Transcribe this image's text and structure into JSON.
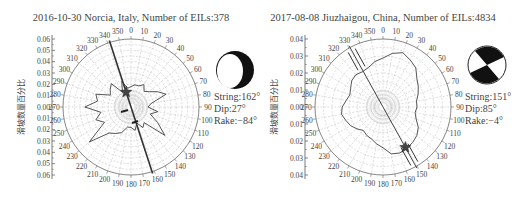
{
  "chart_data": [
    {
      "type": "polar-rose",
      "title": "2016-10-30 Norcia, Italy, Number of EILs:378",
      "ylabel": "滑坡数量百分比",
      "yticks": [
        "0.06",
        "0.05",
        "0.04",
        "0.03",
        "0.02",
        "0.01",
        "0.00",
        "0.01",
        "0.02",
        "0.03",
        "0.04",
        "0.05",
        "0.06"
      ],
      "rmax": 0.06,
      "rings": 6,
      "angle_labels": [
        0,
        10,
        20,
        30,
        40,
        50,
        60,
        70,
        80,
        90,
        100,
        110,
        120,
        130,
        140,
        150,
        160,
        170,
        180,
        190,
        200,
        210,
        220,
        230,
        240,
        250,
        260,
        270,
        280,
        290,
        300,
        310,
        320,
        330,
        340,
        350
      ],
      "bearings_deg": [
        0,
        10,
        20,
        30,
        40,
        50,
        60,
        70,
        80,
        90,
        100,
        110,
        120,
        130,
        140,
        150,
        160,
        170,
        180,
        190,
        200,
        210,
        220,
        230,
        240,
        250,
        260,
        270,
        280,
        290,
        300,
        310,
        320,
        330,
        340,
        350
      ],
      "values_frac": [
        0.3,
        0.33,
        0.33,
        0.38,
        0.3,
        0.35,
        0.45,
        0.55,
        0.3,
        0.25,
        0.4,
        0.3,
        0.45,
        0.65,
        0.3,
        0.35,
        0.25,
        0.35,
        0.3,
        0.3,
        0.4,
        0.45,
        0.5,
        0.8,
        0.45,
        0.55,
        0.45,
        0.68,
        0.5,
        0.55,
        0.35,
        0.4,
        0.45,
        0.25,
        0.4,
        0.28
      ],
      "fault_line_deg": 162,
      "fault_type": "normal",
      "beachball": "normal",
      "focal": {
        "strike": "String:162°",
        "dip": "Dip:27°",
        "rake": "Rake:−84°"
      }
    },
    {
      "type": "polar-rose",
      "title": "2017-08-08 Jiuzhaigou, China, Number of EILs:4834",
      "ylabel": "滑坡数量百分比",
      "yticks": [
        "0.04",
        "0.03",
        "0.02",
        "0.01",
        "0.00",
        "0.01",
        "0.02",
        "0.03",
        "0.04"
      ],
      "rmax": 0.04,
      "rings": 4,
      "angle_labels": [
        0,
        10,
        20,
        30,
        40,
        50,
        60,
        70,
        80,
        90,
        100,
        110,
        120,
        130,
        140,
        150,
        160,
        170,
        180,
        190,
        200,
        210,
        220,
        230,
        240,
        250,
        260,
        270,
        280,
        290,
        300,
        310,
        320,
        330,
        340,
        350
      ],
      "bearings_deg": [
        0,
        10,
        20,
        30,
        40,
        50,
        60,
        70,
        80,
        90,
        100,
        110,
        120,
        130,
        140,
        150,
        160,
        170,
        180,
        190,
        200,
        210,
        220,
        230,
        240,
        250,
        260,
        270,
        280,
        290,
        300,
        310,
        320,
        330,
        340,
        350
      ],
      "values_frac": [
        0.72,
        0.8,
        0.85,
        0.8,
        0.75,
        0.65,
        0.6,
        0.55,
        0.5,
        0.5,
        0.48,
        0.52,
        0.6,
        0.65,
        0.68,
        0.7,
        0.72,
        0.7,
        0.6,
        0.55,
        0.5,
        0.48,
        0.45,
        0.5,
        0.55,
        0.58,
        0.62,
        0.6,
        0.55,
        0.52,
        0.55,
        0.6,
        0.62,
        0.6,
        0.62,
        0.68
      ],
      "fault_line_deg": 151,
      "fault_type": "strike-slip",
      "beachball": "strike-slip",
      "focal": {
        "strike": "String:151°",
        "dip": "Dip:85°",
        "rake": "Rake:−4°"
      }
    }
  ],
  "panels": [
    {
      "cx": 131,
      "cy": 107,
      "r": 68,
      "axis_x": 52,
      "ball_cx": 235,
      "ball_cy": 70,
      "focal_x": 214,
      "focal_y": 100,
      "title_x": 131
    },
    {
      "cx": 383,
      "cy": 107,
      "r": 68,
      "axis_x": 305,
      "ball_cx": 487,
      "ball_cy": 65,
      "focal_x": 465,
      "focal_y": 100,
      "title_x": 383
    }
  ]
}
